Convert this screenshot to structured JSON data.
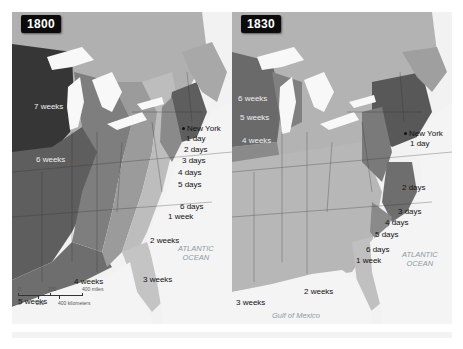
{
  "maps": [
    {
      "id": "1800",
      "year_label": "1800",
      "city": "New York",
      "labels": [
        {
          "text": "7 weeks",
          "x": 22,
          "y": 90,
          "light": true
        },
        {
          "text": "6 weeks",
          "x": 24,
          "y": 143,
          "light": true
        },
        {
          "text": "1 day",
          "x": 174,
          "y": 122
        },
        {
          "text": "2 days",
          "x": 172,
          "y": 133
        },
        {
          "text": "3 days",
          "x": 170,
          "y": 144
        },
        {
          "text": "4 days",
          "x": 166,
          "y": 156
        },
        {
          "text": "5 days",
          "x": 166,
          "y": 168
        },
        {
          "text": "6 days",
          "x": 168,
          "y": 190
        },
        {
          "text": "1 week",
          "x": 156,
          "y": 200
        },
        {
          "text": "2 weeks",
          "x": 138,
          "y": 224
        },
        {
          "text": "3 weeks",
          "x": 131,
          "y": 263
        },
        {
          "text": "4 weeks",
          "x": 62,
          "y": 265
        },
        {
          "text": "5 weeks",
          "x": 6,
          "y": 285
        }
      ],
      "ocean_label": [
        "ATLANTIC",
        "OCEAN"
      ],
      "scale": {
        "miles": [
          "0",
          "200",
          "400 miles"
        ],
        "kilometers": [
          "0",
          "200",
          "400 kilometers"
        ]
      }
    },
    {
      "id": "1830",
      "year_label": "1830",
      "city": "New York",
      "labels": [
        {
          "text": "6 weeks",
          "x": 6,
          "y": 82,
          "light": true
        },
        {
          "text": "5 weeks",
          "x": 8,
          "y": 101,
          "light": true
        },
        {
          "text": "4 weeks",
          "x": 10,
          "y": 124,
          "light": true
        },
        {
          "text": "1 day",
          "x": 178,
          "y": 127
        },
        {
          "text": "2 days",
          "x": 170,
          "y": 171
        },
        {
          "text": "3 days",
          "x": 166,
          "y": 195
        },
        {
          "text": "4 days",
          "x": 153,
          "y": 206
        },
        {
          "text": "5 days",
          "x": 143,
          "y": 218
        },
        {
          "text": "6 days",
          "x": 134,
          "y": 233
        },
        {
          "text": "1 week",
          "x": 124,
          "y": 244
        },
        {
          "text": "2 weeks",
          "x": 72,
          "y": 275
        },
        {
          "text": "3 weeks",
          "x": 4,
          "y": 286
        }
      ],
      "ocean_label": [
        "ATLANTIC",
        "OCEAN"
      ],
      "gulf_label": "Gulf of Mexico"
    }
  ],
  "colors": {
    "water": "#f4f4f4",
    "canada": "#b3b3b3",
    "darkest": "#3a3a3a",
    "dark": "#6a6a6a",
    "mid": "#8d8d8d",
    "light": "#adadad",
    "lighter": "#c8c8c8",
    "lightest": "#dcdcdc"
  }
}
